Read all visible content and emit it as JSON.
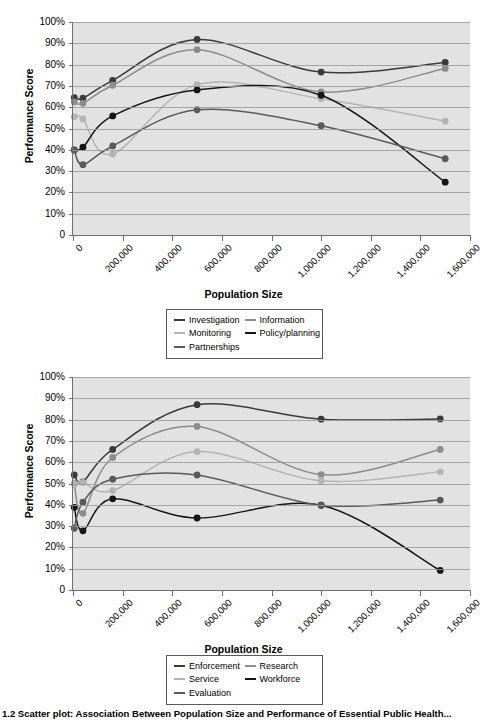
{
  "figure": {
    "caption": "1.2 Scatter plot: Association Between Population Size and Performance of Essential Public Health..."
  },
  "chart_data": [
    {
      "type": "line",
      "title": "",
      "xlabel": "Population Size",
      "ylabel": "Performance Score",
      "xlim": [
        0,
        1600000
      ],
      "ylim": [
        0,
        1.0
      ],
      "grid": true,
      "legend_position": "below",
      "xticks": [
        0,
        200000,
        400000,
        600000,
        800000,
        1000000,
        1200000,
        1400000,
        1600000
      ],
      "xtick_labels": [
        "0",
        "200,000",
        "400,000",
        "600,000",
        "800,000",
        "1,000,000",
        "1,200,000",
        "1,400,000",
        "1,600,000"
      ],
      "yticks": [
        0,
        0.1,
        0.2,
        0.3,
        0.4,
        0.5,
        0.6,
        0.7,
        0.8,
        0.9,
        1.0
      ],
      "ytick_labels": [
        "0",
        "10%",
        "20%",
        "30%",
        "40%",
        "50%",
        "60%",
        "70%",
        "80%",
        "90%",
        "100%"
      ],
      "series": [
        {
          "name": "Investigation",
          "color": "#3a3a3a",
          "x": [
            5000,
            40000,
            160000,
            500000,
            1000000,
            1500000
          ],
          "values": [
            0.645,
            0.642,
            0.726,
            0.918,
            0.765,
            0.81
          ]
        },
        {
          "name": "Information",
          "color": "#8c8c8c",
          "x": [
            5000,
            40000,
            160000,
            500000,
            1000000,
            1500000
          ],
          "values": [
            0.625,
            0.618,
            0.703,
            0.87,
            0.672,
            0.782
          ]
        },
        {
          "name": "Monitoring",
          "color": "#b4b4b4",
          "x": [
            5000,
            40000,
            160000,
            500000,
            1000000,
            1500000
          ],
          "values": [
            0.555,
            0.545,
            0.38,
            0.706,
            0.64,
            0.535
          ]
        },
        {
          "name": "Policy/planning",
          "color": "#151515",
          "x": [
            5000,
            40000,
            160000,
            500000,
            1000000,
            1500000
          ],
          "values": [
            0.4,
            0.412,
            0.559,
            0.681,
            0.656,
            0.248
          ]
        },
        {
          "name": "Partnerships",
          "color": "#595959",
          "x": [
            5000,
            40000,
            160000,
            500000,
            1000000,
            1500000
          ],
          "values": [
            0.398,
            0.33,
            0.418,
            0.588,
            0.513,
            0.358
          ]
        }
      ]
    },
    {
      "type": "line",
      "title": "",
      "xlabel": "Population Size",
      "ylabel": "Performance Score",
      "xlim": [
        0,
        1600000
      ],
      "ylim": [
        0,
        1.0
      ],
      "grid": true,
      "legend_position": "below",
      "xticks": [
        0,
        200000,
        400000,
        600000,
        800000,
        1000000,
        1200000,
        1400000,
        1600000
      ],
      "xtick_labels": [
        "0",
        "200,000",
        "400,000",
        "600,000",
        "800,000",
        "1,000,000",
        "1,200,000",
        "1,400,000",
        "1,600,000"
      ],
      "yticks": [
        0,
        0.1,
        0.2,
        0.3,
        0.4,
        0.5,
        0.6,
        0.7,
        0.8,
        0.9,
        1.0
      ],
      "ytick_labels": [
        "0",
        "10%",
        "20%",
        "30%",
        "40%",
        "50%",
        "60%",
        "70%",
        "80%",
        "90%",
        "100%"
      ],
      "series": [
        {
          "name": "Enforcement",
          "color": "#3a3a3a",
          "x": [
            5000,
            40000,
            160000,
            500000,
            1000000,
            1480000
          ],
          "values": [
            0.54,
            0.508,
            0.66,
            0.87,
            0.802,
            0.803
          ]
        },
        {
          "name": "Research",
          "color": "#8c8c8c",
          "x": [
            5000,
            40000,
            160000,
            500000,
            1000000,
            1480000
          ],
          "values": [
            0.5,
            0.36,
            0.622,
            0.768,
            0.542,
            0.66
          ]
        },
        {
          "name": "Service",
          "color": "#b4b4b4",
          "x": [
            5000,
            40000,
            160000,
            500000,
            1000000,
            1480000
          ],
          "values": [
            0.498,
            0.505,
            0.467,
            0.65,
            0.513,
            0.555
          ]
        },
        {
          "name": "Workforce",
          "color": "#151515",
          "x": [
            5000,
            40000,
            160000,
            500000,
            1000000,
            1480000
          ],
          "values": [
            0.388,
            0.278,
            0.428,
            0.338,
            0.398,
            0.092
          ]
        },
        {
          "name": "Evaluation",
          "color": "#595959",
          "x": [
            5000,
            40000,
            160000,
            500000,
            1000000,
            1480000
          ],
          "values": [
            0.29,
            0.412,
            0.52,
            0.54,
            0.398,
            0.422
          ]
        }
      ]
    }
  ]
}
